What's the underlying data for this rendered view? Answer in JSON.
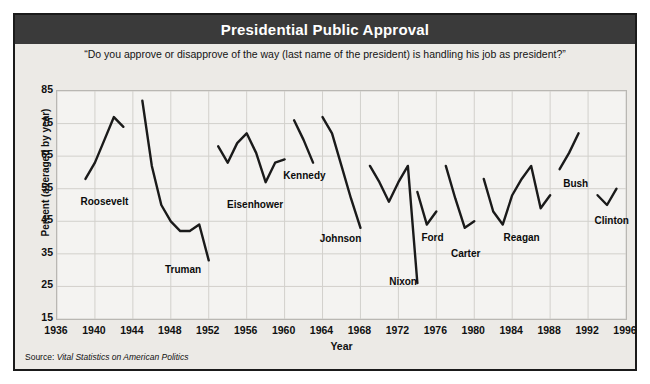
{
  "header": {
    "title": "Presidential Public Approval"
  },
  "subtitle": "“Do you approve or disapprove of the way (last name of the president) is handling his job as president?”",
  "source": {
    "prefix": "Source:",
    "work": "Vital Statistics on American Politics"
  },
  "colors": {
    "titlebar": "#3a3a3a",
    "frame_border": "#1a1a1a",
    "page_background": "#eceae6",
    "plot_background": "#f4f3f1",
    "gridline": "#d2d0cc",
    "line": "#1a1a1a"
  },
  "chart_data": {
    "type": "line",
    "title": "Presidential Public Approval",
    "subtitle": "“Do you approve or disapprove of the way (last name of the president) is handling his job as president?”",
    "xlabel": "Year",
    "ylabel": "Percent (averaged by year)",
    "xlim": [
      1936,
      1996
    ],
    "ylim": [
      15,
      85
    ],
    "xticks": [
      1936,
      1940,
      1944,
      1948,
      1952,
      1956,
      1960,
      1964,
      1968,
      1972,
      1976,
      1980,
      1984,
      1988,
      1992,
      1996
    ],
    "yticks": [
      15,
      25,
      35,
      45,
      55,
      65,
      75,
      85
    ],
    "grid": true,
    "legend": "none (inline series labels)",
    "annotations": [
      {
        "text": "Roosevelt",
        "x": 1941.1,
        "y": 52.5
      },
      {
        "text": "Truman",
        "x": 1949.4,
        "y": 31.5
      },
      {
        "text": "Eisenhower",
        "x": 1957.0,
        "y": 51.5
      },
      {
        "text": "Kennedy",
        "x": 1962.2,
        "y": 60.5
      },
      {
        "text": "Johnson",
        "x": 1966.0,
        "y": 41.0
      },
      {
        "text": "Nixon",
        "x": 1972.6,
        "y": 28.0
      },
      {
        "text": "Ford",
        "x": 1975.7,
        "y": 41.5
      },
      {
        "text": "Carter",
        "x": 1979.2,
        "y": 36.5
      },
      {
        "text": "Reagan",
        "x": 1985.1,
        "y": 41.5
      },
      {
        "text": "Bush",
        "x": 1990.8,
        "y": 58.0
      },
      {
        "text": "Clinton",
        "x": 1994.6,
        "y": 46.5
      }
    ],
    "series": [
      {
        "name": "Roosevelt",
        "x": [
          1939,
          1940,
          1941,
          1942,
          1943
        ],
        "values": [
          58,
          63,
          70,
          77,
          74
        ]
      },
      {
        "name": "Truman",
        "x": [
          1945,
          1946,
          1947,
          1948,
          1949,
          1950,
          1951,
          1952
        ],
        "values": [
          82,
          62,
          50,
          45,
          42,
          42,
          44,
          33
        ]
      },
      {
        "name": "Eisenhower",
        "x": [
          1953,
          1954,
          1955,
          1956,
          1957,
          1958,
          1959,
          1960
        ],
        "values": [
          68,
          63,
          69,
          72,
          66,
          57,
          63,
          64
        ]
      },
      {
        "name": "Kennedy",
        "x": [
          1961,
          1962,
          1963
        ],
        "values": [
          76,
          70,
          63
        ]
      },
      {
        "name": "Johnson",
        "x": [
          1964,
          1965,
          1966,
          1967,
          1968
        ],
        "values": [
          77,
          72,
          62,
          52,
          43
        ]
      },
      {
        "name": "Nixon",
        "x": [
          1969,
          1970,
          1971,
          1972,
          1973,
          1974
        ],
        "values": [
          62,
          57,
          51,
          57,
          62,
          26
        ]
      },
      {
        "name": "Ford",
        "x": [
          1974,
          1975,
          1976
        ],
        "values": [
          54,
          44,
          48
        ]
      },
      {
        "name": "Carter",
        "x": [
          1977,
          1978,
          1979,
          1980
        ],
        "values": [
          62,
          52,
          43,
          45
        ]
      },
      {
        "name": "Reagan",
        "x": [
          1981,
          1982,
          1983,
          1984,
          1985,
          1986,
          1987,
          1988
        ],
        "values": [
          58,
          48,
          44,
          53,
          58,
          62,
          49,
          53
        ]
      },
      {
        "name": "Bush",
        "x": [
          1989,
          1990,
          1991
        ],
        "values": [
          61,
          66,
          72
        ]
      },
      {
        "name": "Clinton",
        "x": [
          1993,
          1994,
          1995
        ],
        "values": [
          53,
          50,
          55
        ]
      }
    ]
  }
}
